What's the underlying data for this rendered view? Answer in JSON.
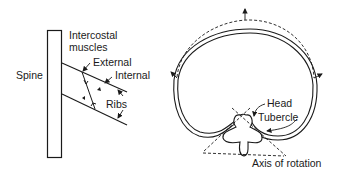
{
  "left_figure": {
    "labels": {
      "intercostal_line1": "Intercostal",
      "intercostal_line2": "muscles",
      "spine": "Spine",
      "external": "External",
      "internal": "Internal",
      "ribs": "Ribs"
    }
  },
  "right_figure": {
    "labels": {
      "head": "Head",
      "tubercle": "Tubercle",
      "axis": "Axis of rotation"
    }
  },
  "colors": {
    "stroke": "#1a1a1a",
    "background": "#ffffff"
  }
}
